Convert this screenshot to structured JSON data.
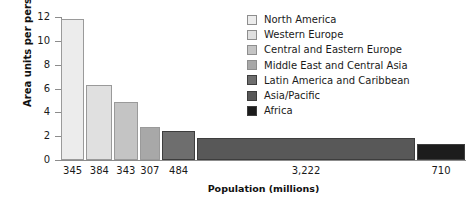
{
  "chart_data": {
    "type": "bar",
    "variant": "variable-width-bar",
    "title": "",
    "xlabel": "Population (millions)",
    "ylabel": "Area units per person",
    "ylim": [
      0,
      12
    ],
    "yticks": [
      0,
      2,
      4,
      6,
      8,
      10,
      12
    ],
    "ytick_labels": [
      "0",
      "2",
      "4",
      "6",
      "8",
      "10",
      "12"
    ],
    "grid": false,
    "legend_position": "top-right",
    "categories": [
      "North America",
      "Western Europe",
      "Central and Eastern Europe",
      "Middle East and Central Asia",
      "Latin America and Caribbean",
      "Asia/Pacific",
      "Africa"
    ],
    "x_tick_labels": [
      "345",
      "384",
      "343",
      "307",
      "484",
      "3,222",
      "710"
    ],
    "widths_population_millions": [
      345,
      384,
      343,
      307,
      484,
      3222,
      710
    ],
    "values_area_units_per_person": [
      11.8,
      6.3,
      4.9,
      2.75,
      2.45,
      1.85,
      1.35
    ],
    "colors": [
      "#ececec",
      "#e0e0e0",
      "#c4c4c4",
      "#a8a8a8",
      "#6e6e6e",
      "#585858",
      "#1c1c1c"
    ]
  },
  "legend": {
    "items": [
      {
        "label": "North America",
        "color": "#ececec"
      },
      {
        "label": "Western Europe",
        "color": "#e0e0e0"
      },
      {
        "label": "Central and Eastern Europe",
        "color": "#c4c4c4"
      },
      {
        "label": "Middle East and Central Asia",
        "color": "#a8a8a8"
      },
      {
        "label": "Latin America and Caribbean",
        "color": "#6e6e6e"
      },
      {
        "label": "Asia/Pacific",
        "color": "#585858"
      },
      {
        "label": "Africa",
        "color": "#1c1c1c"
      }
    ]
  }
}
